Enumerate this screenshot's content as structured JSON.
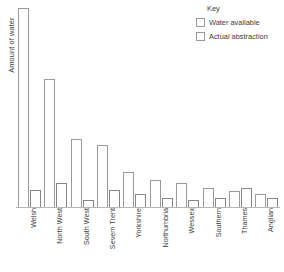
{
  "chart_data": {
    "type": "bar",
    "title": "",
    "xlabel": "",
    "ylabel": "Amount of water",
    "grid": false,
    "legend_position": "top-right",
    "legend_title": "Key",
    "categories": [
      "Welsh",
      "North West",
      "South West",
      "Severn Trent",
      "Yorkshire",
      "Northumbria",
      "Wessex",
      "Southern",
      "Thames",
      "Anglian"
    ],
    "series": [
      {
        "name": "Water available",
        "values": [
          200,
          129,
          69,
          63,
          36,
          28,
          25,
          20,
          17,
          14
        ]
      },
      {
        "name": "Actual abstraction",
        "values": [
          18,
          25,
          8,
          18,
          14,
          10,
          8,
          10,
          20,
          10
        ]
      }
    ],
    "ylim": [
      0,
      204
    ],
    "y_ticks_shown": false
  },
  "axes": {
    "y_title": "Amount of water"
  },
  "legend": {
    "title": "Key",
    "entries": [
      {
        "label": "Water available"
      },
      {
        "label": "Actual abstraction"
      }
    ]
  },
  "colors": {
    "bar_outline": "#9a9a9a",
    "bar_fill": "#ffffff",
    "axis_line": "#b5b5b5",
    "text": "#3b3b3b",
    "background": "#ffffff"
  }
}
